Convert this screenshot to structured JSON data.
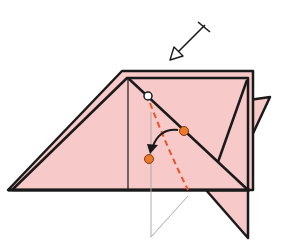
{
  "diagram": {
    "title": "Origami fold step",
    "paper_color": "#f7c9c9",
    "line_color": "#1a1a1a",
    "fold_line_color": "#e8532a",
    "marker_orange": "#e97a2c",
    "marker_white": "#ffffff",
    "ghost_line_color": "#b0a8a8",
    "symbols": [
      {
        "name": "turn-over-arrow-icon",
        "meaning": "view / push-in arrow from upper right"
      },
      {
        "name": "valley-fold-line",
        "meaning": "dashed orange fold line"
      },
      {
        "name": "fold-direction-arrow-icon",
        "meaning": "curved black arrow bringing point down-left"
      },
      {
        "name": "reference-point-white",
        "meaning": "white circle pivot point"
      },
      {
        "name": "reference-point-orange-a",
        "meaning": "orange dot on diagonal edge"
      },
      {
        "name": "reference-point-orange-b",
        "meaning": "orange dot target position"
      }
    ]
  }
}
